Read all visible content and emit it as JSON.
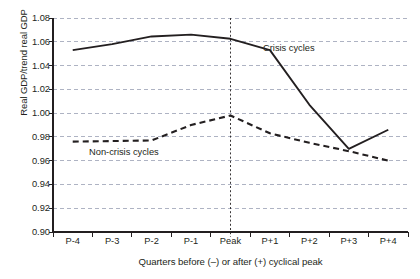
{
  "chart_data": {
    "type": "line",
    "title": "",
    "xlabel": "Quarters before (–) or after (+) cyclical peak",
    "ylabel": "Real GDP/trend real GDP",
    "categories": [
      "P-4",
      "P-3",
      "P-2",
      "P-1",
      "Peak",
      "P+1",
      "P+2",
      "P+3",
      "P+4"
    ],
    "ylim": [
      0.9,
      1.08
    ],
    "yticks": [
      "1.08",
      "1.06",
      "1.04",
      "1.02",
      "1.00",
      "0.98",
      "0.96",
      "0.94",
      "0.92",
      "0.90"
    ],
    "ytick_values": [
      1.08,
      1.06,
      1.04,
      1.02,
      1.0,
      0.98,
      0.96,
      0.94,
      0.92,
      0.9
    ],
    "grid": "horizontal-dashed",
    "legend_position": "inline-annotations",
    "annotations": [
      {
        "text": "Crisis cycles",
        "series": "Crisis cycles"
      },
      {
        "text": "Non-crisis cycles",
        "series": "Non-crisis cycles"
      }
    ],
    "reference_line": {
      "at": "Peak",
      "style": "dashed-vertical"
    },
    "series": [
      {
        "name": "Crisis cycles",
        "style": "solid",
        "color": "#231f20",
        "values": [
          1.053,
          1.058,
          1.0645,
          1.066,
          1.0625,
          1.053,
          1.007,
          0.97,
          0.986
        ]
      },
      {
        "name": "Non-crisis cycles",
        "style": "dashed",
        "color": "#231f20",
        "values": [
          0.976,
          0.9765,
          0.977,
          0.99,
          0.998,
          0.983,
          0.975,
          0.968,
          0.96
        ]
      }
    ]
  }
}
